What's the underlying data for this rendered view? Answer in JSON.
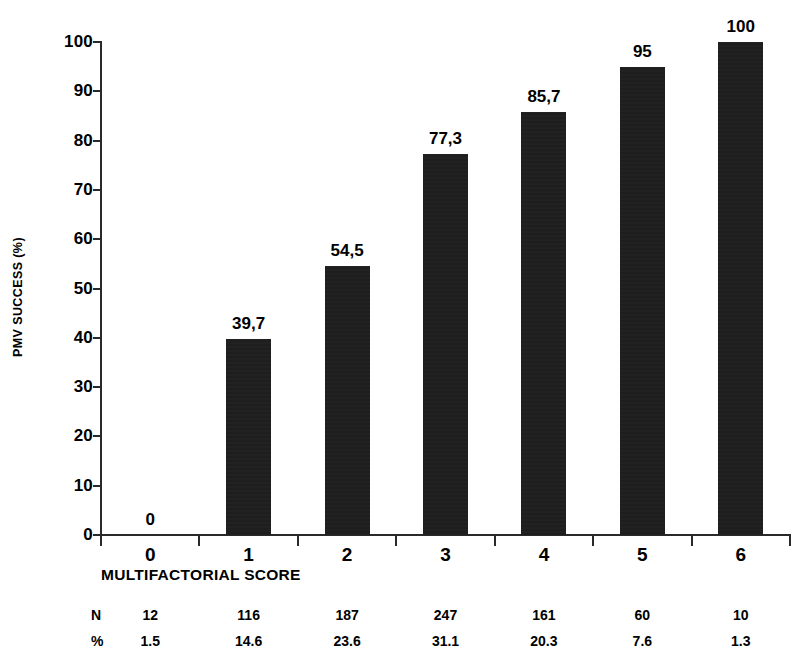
{
  "chart_data": {
    "type": "bar",
    "title": "",
    "xlabel": "MULTIFACTORIAL SCORE",
    "ylabel": "PMV SUCCESS (%)",
    "categories": [
      "0",
      "1",
      "2",
      "3",
      "4",
      "5",
      "6"
    ],
    "values": [
      0,
      39.7,
      54.5,
      77.3,
      85.7,
      95,
      100
    ],
    "value_labels": [
      "0",
      "39,7",
      "54,5",
      "77,3",
      "85,7",
      "95",
      "100"
    ],
    "ylim": [
      0,
      100
    ],
    "ytick_values": [
      0,
      10,
      20,
      30,
      40,
      50,
      60,
      70,
      80,
      90,
      100
    ],
    "ytick_labels": [
      "0",
      "10",
      "20",
      "30",
      "40",
      "50",
      "60",
      "70",
      "80",
      "90",
      "100"
    ],
    "grid": false,
    "legend": "none",
    "bar_color": "#1c1c1c",
    "axis_color": "#2a2a2a",
    "table": {
      "row_labels": [
        "N",
        "%"
      ],
      "rows": [
        [
          "12",
          "116",
          "187",
          "247",
          "161",
          "60",
          "10"
        ],
        [
          "1.5",
          "14.6",
          "23.6",
          "31.1",
          "20.3",
          "7.6",
          "1.3"
        ]
      ]
    }
  }
}
